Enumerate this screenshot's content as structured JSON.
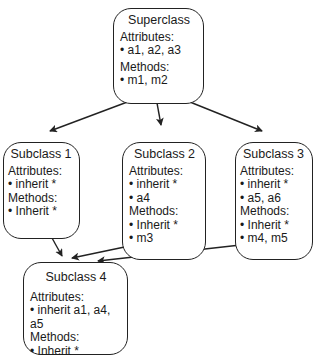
{
  "diagram": {
    "type": "class-inheritance",
    "nodes": [
      {
        "id": "superclass",
        "title": "Superclass",
        "attributes_label": "Attributes:",
        "attributes": [
          "a1, a2, a3"
        ],
        "methods_label": "Methods:",
        "methods": [
          "m1, m2"
        ]
      },
      {
        "id": "subclass1",
        "title": "Subclass 1",
        "attributes_label": "Attributes:",
        "attributes": [
          "inherit *"
        ],
        "methods_label": "Methods:",
        "methods": [
          "Inherit *"
        ]
      },
      {
        "id": "subclass2",
        "title": "Subclass 2",
        "attributes_label": "Attributes:",
        "attributes": [
          "inherit *",
          "a4"
        ],
        "methods_label": "Methods:",
        "methods": [
          "Inherit *",
          "m3"
        ]
      },
      {
        "id": "subclass3",
        "title": "Subclass 3",
        "attributes_label": "Attributes:",
        "attributes": [
          "inherit *",
          "a5, a6"
        ],
        "methods_label": "Methods:",
        "methods": [
          "Inherit *",
          "m4, m5"
        ]
      },
      {
        "id": "subclass4",
        "title": "Subclass 4",
        "attributes_label": "Attributes:",
        "attributes": [
          "inherit a1, a4, a5"
        ],
        "methods_label": "Methods:",
        "methods": [
          "Inherit *"
        ]
      }
    ],
    "edges": [
      {
        "from": "superclass",
        "to": "subclass1"
      },
      {
        "from": "superclass",
        "to": "subclass2"
      },
      {
        "from": "superclass",
        "to": "subclass3"
      },
      {
        "from": "subclass1",
        "to": "subclass4"
      },
      {
        "from": "subclass2",
        "to": "subclass4"
      },
      {
        "from": "subclass3",
        "to": "subclass4"
      }
    ],
    "colors": {
      "stroke": "#222222",
      "background": "#ffffff",
      "text": "#1a1a1a"
    }
  }
}
